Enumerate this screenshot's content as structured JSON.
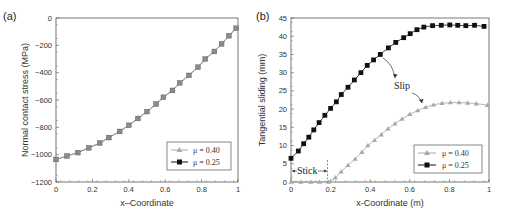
{
  "chart_data": [
    {
      "panel": "(a)",
      "type": "line",
      "title": "",
      "xlabel": "x–Coordinate",
      "ylabel": "Normal contact stress (MPa)",
      "xlim": [
        0,
        1
      ],
      "ylim": [
        -1200,
        0
      ],
      "xticks": [
        "0",
        "0.2",
        "0.4",
        "0.6",
        "0.8",
        "1"
      ],
      "yticks": [
        "0",
        "-200",
        "-400",
        "-600",
        "-800",
        "-1000",
        "-1200"
      ],
      "grid": false,
      "legend_position": "lower right",
      "series": [
        {
          "name": "μ = 0.40",
          "marker": "triangle",
          "color": "#9a9a9a",
          "x": [
            0,
            0.06,
            0.12,
            0.18,
            0.24,
            0.29,
            0.35,
            0.4,
            0.45,
            0.5,
            0.55,
            0.59,
            0.64,
            0.68,
            0.73,
            0.78,
            0.82,
            0.87,
            0.91,
            0.95,
            0.99
          ],
          "values": [
            -1035,
            -1010,
            -985,
            -950,
            -915,
            -875,
            -830,
            -785,
            -735,
            -685,
            -630,
            -580,
            -530,
            -475,
            -420,
            -360,
            -300,
            -245,
            -190,
            -130,
            -75
          ]
        },
        {
          "name": "μ = 0.25",
          "marker": "square",
          "color": "#111111",
          "x": [
            0,
            0.06,
            0.12,
            0.18,
            0.24,
            0.29,
            0.35,
            0.4,
            0.45,
            0.5,
            0.55,
            0.59,
            0.64,
            0.68,
            0.73,
            0.78,
            0.82,
            0.87,
            0.91,
            0.95,
            0.99
          ],
          "values": [
            -1035,
            -1010,
            -985,
            -950,
            -915,
            -875,
            -830,
            -785,
            -735,
            -685,
            -630,
            -580,
            -530,
            -475,
            -420,
            -360,
            -300,
            -245,
            -190,
            -130,
            -75
          ]
        }
      ]
    },
    {
      "panel": "(b)",
      "type": "line",
      "title": "",
      "xlabel": "x-Coordinate (m)",
      "ylabel": "Tangential sliding (mm)",
      "xlim": [
        0,
        1
      ],
      "ylim": [
        0,
        45
      ],
      "xticks": [
        "0",
        "0.2",
        "0.4",
        "0.6",
        "0.8",
        "1"
      ],
      "yticks": [
        "0",
        "5",
        "10",
        "15",
        "20",
        "25",
        "30",
        "35",
        "40",
        "45"
      ],
      "grid": false,
      "legend_position": "lower right",
      "annotations": [
        "Stick",
        "Slip"
      ],
      "series": [
        {
          "name": "μ = 0.40",
          "marker": "triangle",
          "color": "#a8a8a8",
          "x": [
            0,
            0.05,
            0.1,
            0.144,
            0.19,
            0.224,
            0.253,
            0.288,
            0.324,
            0.358,
            0.388,
            0.422,
            0.456,
            0.49,
            0.525,
            0.561,
            0.6,
            0.64,
            0.68,
            0.72,
            0.763,
            0.805,
            0.849,
            0.892,
            0.936,
            0.992
          ],
          "values": [
            0,
            0,
            0,
            0,
            0,
            1.2,
            2.8,
            4.6,
            6.3,
            8.2,
            10,
            11.5,
            13,
            14.6,
            16,
            17.3,
            18.6,
            19.6,
            20.5,
            21.2,
            21.6,
            21.8,
            21.8,
            21.7,
            21.5,
            21.1
          ]
        },
        {
          "name": "μ = 0.25",
          "marker": "square",
          "color": "#111111",
          "x": [
            0,
            0.037,
            0.064,
            0.09,
            0.115,
            0.142,
            0.171,
            0.2,
            0.229,
            0.254,
            0.288,
            0.32,
            0.353,
            0.385,
            0.417,
            0.451,
            0.492,
            0.529,
            0.569,
            0.602,
            0.636,
            0.671,
            0.715,
            0.759,
            0.802,
            0.842,
            0.883,
            0.927,
            0.975
          ],
          "values": [
            6.5,
            8.5,
            10.5,
            12.3,
            14.3,
            16.3,
            18.3,
            20.2,
            22,
            24,
            26,
            28,
            30,
            32,
            33.5,
            35,
            36.8,
            38.3,
            39.6,
            40.7,
            41.8,
            42.5,
            42.9,
            43.0,
            43.1,
            43.0,
            42.9,
            43.0,
            42.7
          ]
        }
      ]
    }
  ]
}
